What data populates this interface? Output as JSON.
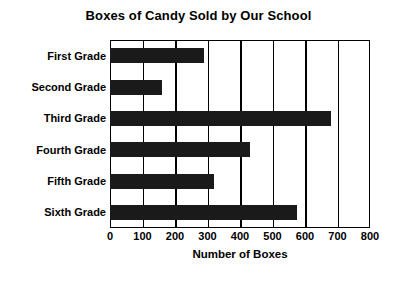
{
  "chart_data": {
    "type": "bar",
    "orientation": "horizontal",
    "title": "Boxes of Candy Sold by Our School",
    "xlabel": "Number of Boxes",
    "ylabel": "",
    "categories": [
      "First Grade",
      "Second Grade",
      "Third Grade",
      "Fourth Grade",
      "Fifth Grade",
      "Sixth Grade"
    ],
    "values": [
      290,
      160,
      680,
      430,
      320,
      575
    ],
    "xlim": [
      0,
      800
    ],
    "xticks": [
      0,
      100,
      200,
      300,
      400,
      500,
      600,
      700,
      800
    ],
    "xtick_labels": [
      "0",
      "100",
      "200",
      "300",
      "400",
      "500",
      "600",
      "700",
      "800"
    ],
    "grid": "vertical",
    "legend": "none",
    "bar_color": "#1a1a1a",
    "axis_color": "#000000",
    "background": "#ffffff"
  }
}
